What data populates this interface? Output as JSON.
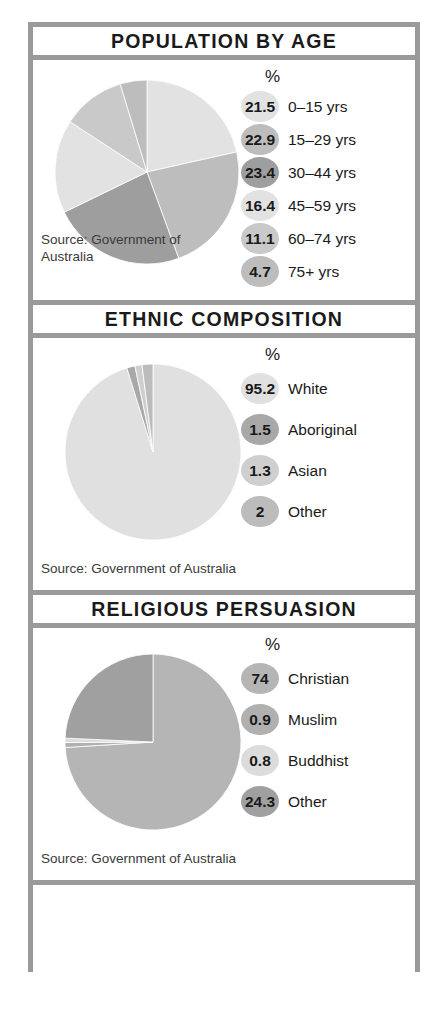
{
  "infographic": {
    "sections": [
      {
        "id": "population-by-age",
        "title": "POPULATION BY AGE",
        "percent_header": "%",
        "source": "Source: Government of\nAustralia",
        "legend": [
          {
            "value": "21.5",
            "label": "0–15 yrs",
            "color": "#e2e2e2"
          },
          {
            "value": "22.9",
            "label": "15–29 yrs",
            "color": "#bdbdbd"
          },
          {
            "value": "23.4",
            "label": "30–44 yrs",
            "color": "#9e9e9e"
          },
          {
            "value": "16.4",
            "label": "45–59 yrs",
            "color": "#e2e2e2"
          },
          {
            "value": "11.1",
            "label": "60–74 yrs",
            "color": "#c9c9c9"
          },
          {
            "value": "4.7",
            "label": "75+ yrs",
            "color": "#bdbdbd"
          }
        ]
      },
      {
        "id": "ethnic-composition",
        "title": "ETHNIC COMPOSITION",
        "percent_header": "%",
        "source": "Source: Government of Australia",
        "legend": [
          {
            "value": "95.2",
            "label": "White",
            "color": "#e0e0e0"
          },
          {
            "value": "1.5",
            "label": "Aboriginal",
            "color": "#a8a8a8"
          },
          {
            "value": "1.3",
            "label": "Asian",
            "color": "#cfcfcf"
          },
          {
            "value": "2",
            "label": "Other",
            "color": "#bcbcbc"
          }
        ]
      },
      {
        "id": "religious-persuasion",
        "title": "RELIGIOUS PERSUASION",
        "percent_header": "%",
        "source": "Source: Government of Australia",
        "legend": [
          {
            "value": "74",
            "label": "Christian",
            "color": "#b5b5b5"
          },
          {
            "value": "0.9",
            "label": "Muslim",
            "color": "#b0b0b0"
          },
          {
            "value": "0.8",
            "label": "Buddhist",
            "color": "#dcdcdc"
          },
          {
            "value": "24.3",
            "label": "Other",
            "color": "#a0a0a0"
          }
        ]
      }
    ]
  },
  "chart_data": [
    {
      "type": "pie",
      "title": "POPULATION BY AGE",
      "categories": [
        "0–15 yrs",
        "15–29 yrs",
        "30–44 yrs",
        "45–59 yrs",
        "60–74 yrs",
        "75+ yrs"
      ],
      "values": [
        21.5,
        22.9,
        23.4,
        16.4,
        11.1,
        4.7
      ],
      "unit": "%",
      "colors": [
        "#e2e2e2",
        "#bdbdbd",
        "#9e9e9e",
        "#e2e2e2",
        "#c9c9c9",
        "#bdbdbd"
      ],
      "start_angle": 0,
      "direction": "clockwise",
      "legend_position": "right",
      "source": "Source: Government of Australia"
    },
    {
      "type": "pie",
      "title": "ETHNIC COMPOSITION",
      "categories": [
        "White",
        "Aboriginal",
        "Asian",
        "Other"
      ],
      "values": [
        95.2,
        1.5,
        1.3,
        2
      ],
      "unit": "%",
      "colors": [
        "#e0e0e0",
        "#a8a8a8",
        "#cfcfcf",
        "#bcbcbc"
      ],
      "start_angle": 0,
      "direction": "clockwise",
      "legend_position": "right",
      "source": "Source: Government of Australia"
    },
    {
      "type": "pie",
      "title": "RELIGIOUS PERSUASION",
      "categories": [
        "Christian",
        "Muslim",
        "Buddhist",
        "Other"
      ],
      "values": [
        74,
        0.9,
        0.8,
        24.3
      ],
      "unit": "%",
      "colors": [
        "#b5b5b5",
        "#b0b0b0",
        "#dcdcdc",
        "#a0a0a0"
      ],
      "start_angle": 0,
      "direction": "clockwise",
      "legend_position": "right",
      "source": "Source: Government of Australia"
    }
  ]
}
